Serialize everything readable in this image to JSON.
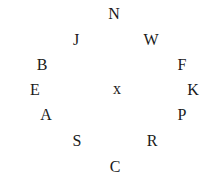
{
  "diagram": {
    "type": "circular-letter-arrangement",
    "center": {
      "label": "x",
      "cx": 117,
      "cy": 91
    },
    "labels": [
      {
        "id": "N",
        "text": "N",
        "cx": 114,
        "cy": 14
      },
      {
        "id": "W",
        "text": "W",
        "cx": 151,
        "cy": 40
      },
      {
        "id": "F",
        "text": "F",
        "cx": 182,
        "cy": 65
      },
      {
        "id": "K",
        "text": "K",
        "cx": 193,
        "cy": 90
      },
      {
        "id": "P",
        "text": "P",
        "cx": 182,
        "cy": 115
      },
      {
        "id": "R",
        "text": "R",
        "cx": 152,
        "cy": 141
      },
      {
        "id": "C",
        "text": "C",
        "cx": 115,
        "cy": 167
      },
      {
        "id": "S",
        "text": "S",
        "cx": 77,
        "cy": 141
      },
      {
        "id": "A",
        "text": "A",
        "cx": 46,
        "cy": 115
      },
      {
        "id": "E",
        "text": "E",
        "cx": 35,
        "cy": 90
      },
      {
        "id": "B",
        "text": "B",
        "cx": 42,
        "cy": 65
      },
      {
        "id": "J",
        "text": "J",
        "cx": 76,
        "cy": 40
      }
    ],
    "text_color": "#1a1a1a",
    "background": "#ffffff"
  }
}
